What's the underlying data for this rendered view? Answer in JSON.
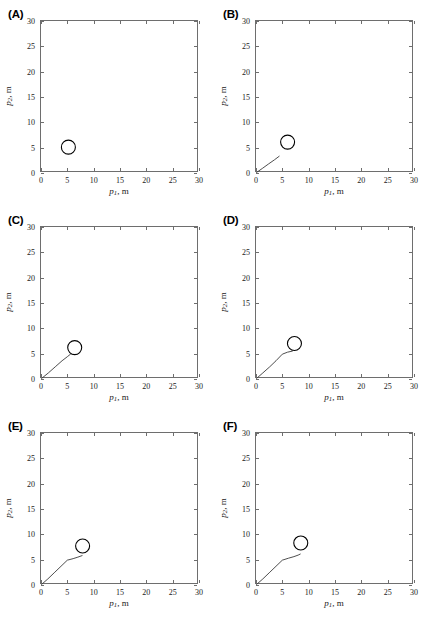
{
  "figure": {
    "title": "",
    "panel_label_format": "(X)",
    "rows": 3,
    "cols": 2
  },
  "axis": {
    "xlabel_var": "p",
    "xlabel_sub": "1",
    "xlabel_unit": ", m",
    "ylabel_var": "p",
    "ylabel_sub": "2",
    "ylabel_unit": ", m",
    "xticks": [
      "0",
      "5",
      "10",
      "15",
      "20",
      "25",
      "30"
    ],
    "yticks": [
      "0",
      "5",
      "10",
      "15",
      "20",
      "25",
      "30"
    ],
    "xlim": [
      0,
      30
    ],
    "ylim": [
      0,
      30
    ],
    "grid": false,
    "box": true,
    "axis_color": "#6e6e6e",
    "line_color": "#3a3a3a",
    "marker_color": "#000000"
  },
  "chart_data": {
    "type": "line",
    "title": "",
    "xlabel": "p1, m",
    "ylabel": "p2, m",
    "xlim": [
      0,
      30
    ],
    "ylim": [
      0,
      30
    ],
    "grid": false,
    "legend": "none",
    "panels": [
      {
        "label": "(A)",
        "target_marker": {
          "shape": "circle",
          "x": 5.2,
          "y": 5.1,
          "radius_px": 7
        },
        "trajectory": {
          "x": [],
          "y": []
        }
      },
      {
        "label": "(B)",
        "target_marker": {
          "shape": "circle",
          "x": 6.0,
          "y": 6.1,
          "radius_px": 7
        },
        "trajectory": {
          "x": [
            0.1,
            1.2,
            2.4,
            3.5,
            4.4
          ],
          "y": [
            0.1,
            0.9,
            1.8,
            2.6,
            3.3
          ]
        }
      },
      {
        "label": "(C)",
        "target_marker": {
          "shape": "circle",
          "x": 6.4,
          "y": 6.2,
          "radius_px": 7
        },
        "trajectory": {
          "x": [
            0.1,
            1.4,
            2.7,
            4.0,
            5.0,
            5.6
          ],
          "y": [
            0.1,
            1.2,
            2.4,
            3.6,
            4.4,
            4.9
          ]
        }
      },
      {
        "label": "(D)",
        "target_marker": {
          "shape": "circle",
          "x": 7.3,
          "y": 7.0,
          "radius_px": 7
        },
        "trajectory": {
          "x": [
            0.1,
            1.3,
            2.6,
            3.8,
            5.0,
            6.0,
            6.9
          ],
          "y": [
            0.1,
            1.2,
            2.4,
            3.6,
            4.9,
            5.3,
            5.5
          ]
        }
      },
      {
        "label": "(E)",
        "target_marker": {
          "shape": "circle",
          "x": 7.9,
          "y": 7.7,
          "radius_px": 7
        },
        "trajectory": {
          "x": [
            0.1,
            1.3,
            2.5,
            3.8,
            5.0,
            6.1,
            7.0,
            7.8
          ],
          "y": [
            0.1,
            1.2,
            2.4,
            3.7,
            4.9,
            5.2,
            5.5,
            5.8
          ]
        }
      },
      {
        "label": "(F)",
        "target_marker": {
          "shape": "circle",
          "x": 8.5,
          "y": 8.3,
          "radius_px": 7
        },
        "trajectory": {
          "x": [
            0.1,
            1.3,
            2.5,
            3.8,
            5.0,
            6.2,
            7.2,
            8.0,
            8.4
          ],
          "y": [
            0.1,
            1.2,
            2.4,
            3.7,
            4.9,
            5.3,
            5.6,
            5.9,
            6.1
          ]
        }
      }
    ]
  }
}
